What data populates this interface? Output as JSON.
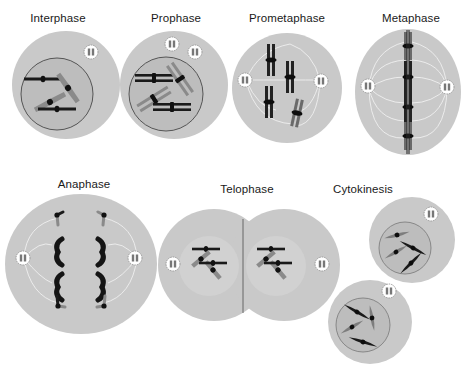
{
  "colors": {
    "cell": "#c9c9c9",
    "cell_light": "#d7d7d7",
    "nucleus": "#bdbdbd",
    "nucleus_border": "#555555",
    "chromosome_dark": "#1a1a1a",
    "chromosome_gray": "#808080",
    "spindle": "#f2f2f2",
    "centrosome": "#ffffff"
  },
  "stages": [
    {
      "id": "interphase",
      "label": "Interphase",
      "label_x": 58,
      "label_y": 12
    },
    {
      "id": "prophase",
      "label": "Prophase",
      "label_x": 176,
      "label_y": 12
    },
    {
      "id": "prometaphase",
      "label": "Prometaphase",
      "label_x": 287,
      "label_y": 12
    },
    {
      "id": "metaphase",
      "label": "Metaphase",
      "label_x": 411,
      "label_y": 12
    },
    {
      "id": "anaphase",
      "label": "Anaphase",
      "label_x": 84,
      "label_y": 178
    },
    {
      "id": "telophase",
      "label": "Telophase",
      "label_x": 247,
      "label_y": 183
    },
    {
      "id": "cytokinesis",
      "label": "Cytokinesis",
      "label_x": 363,
      "label_y": 183
    }
  ]
}
